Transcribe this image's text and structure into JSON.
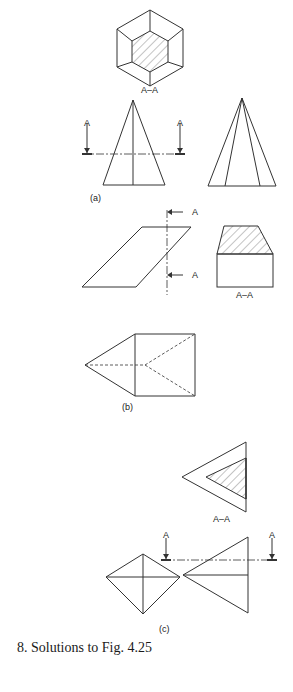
{
  "figure": {
    "caption": "8. Solutions to Fig. 4.25",
    "parts": {
      "a": {
        "label": "(a)",
        "section_label": "A–A",
        "cut_marker_left": "A",
        "cut_marker_right": "A"
      },
      "b": {
        "label": "(b)",
        "section_label": "A–A",
        "cut_marker_top": "A",
        "cut_marker_bottom": "A"
      },
      "c": {
        "label": "(c)",
        "section_label": "A–A",
        "cut_marker_left": "A",
        "cut_marker_right": "A"
      }
    }
  },
  "colors": {
    "line": "#333333",
    "background": "#ffffff"
  }
}
